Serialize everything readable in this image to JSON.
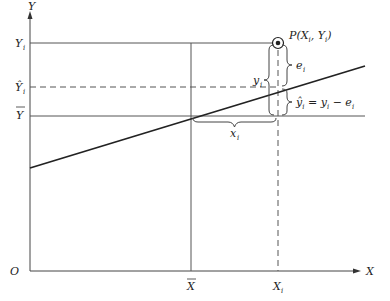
{
  "diagram": {
    "type": "regression-deviation-diagram",
    "axes": {
      "y_label": "Y",
      "x_label": "X",
      "origin_label": "O"
    },
    "y_ticks": {
      "y_i": "Y",
      "y_i_sub": "i",
      "y_hat": "Ŷ",
      "y_hat_sub": "i",
      "y_bar": "Y"
    },
    "x_ticks": {
      "x_bar": "X",
      "x_i": "X",
      "x_i_sub": "i"
    },
    "point": {
      "label": "P(X",
      "sub1": "i",
      "mid": ", Y",
      "sub2": "i",
      "close": ")"
    },
    "annotations": {
      "e_i": "e",
      "e_i_sub": "i",
      "y_i": "y",
      "y_i_sub": "i",
      "x_i": "x",
      "x_i_sub": "i",
      "yhat_eq_a": "ŷ",
      "yhat_eq_a_sub": "i",
      "yhat_eq_b": " = y",
      "yhat_eq_b_sub": "i",
      "yhat_eq_c": " − e",
      "yhat_eq_c_sub": "i"
    },
    "colors": {
      "line": "#222222",
      "axis": "#444444",
      "thin": "#555555"
    }
  }
}
